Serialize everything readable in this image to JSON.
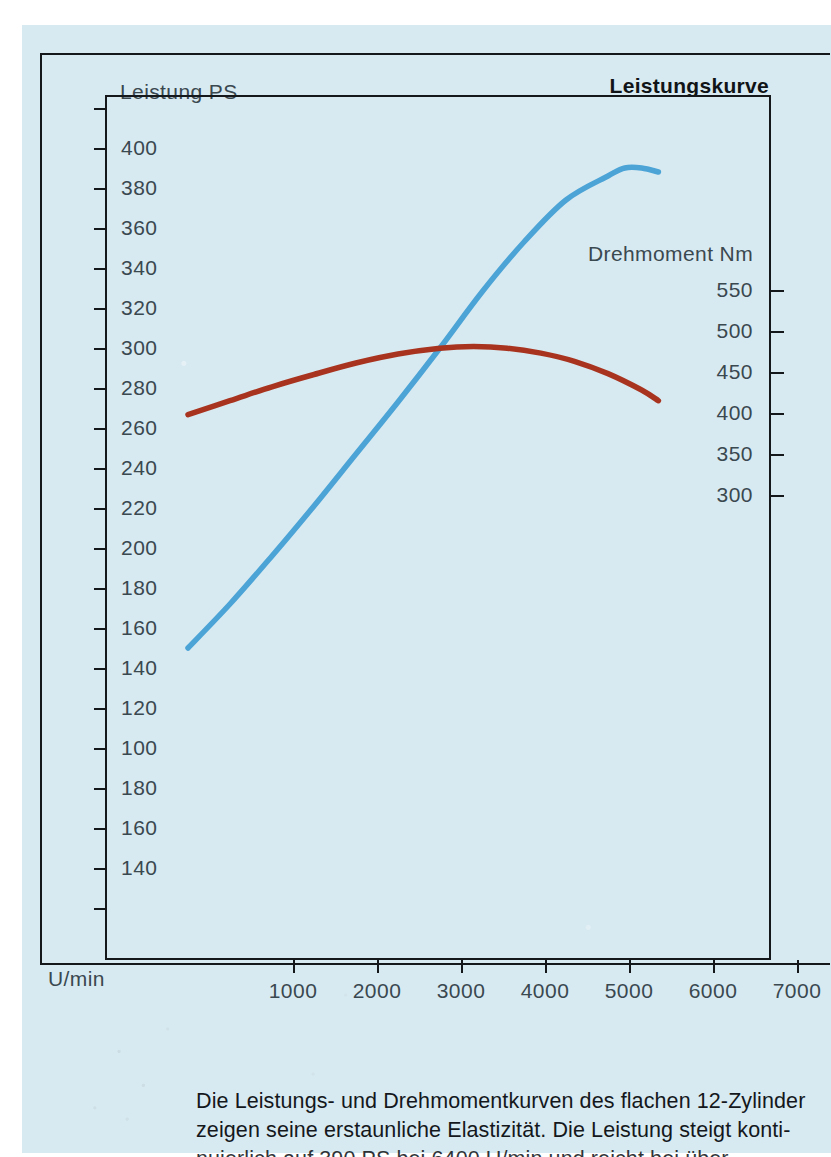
{
  "chart_title": "Leistungskurve",
  "axis_titles": {
    "left": "Leistung PS",
    "right": "Drehmoment Nm",
    "x": "U/min"
  },
  "caption": {
    "line1": "Die Leistungs- und Drehmomentkurven des flachen 12-Zylinder",
    "line2": "zeigen seine erstaunliche Elastizität. Die Leistung steigt konti-",
    "line3": "nuierlich auf 390 PS bei 6400 U/min und reicht bei über"
  },
  "colors": {
    "page": "#d8eaf1",
    "power_curve": "#4ba3d6",
    "torque_curve": "#a8341f",
    "axis": "#15181a",
    "tick_label": "#3a4850"
  },
  "chart_data": {
    "type": "line",
    "title": "Leistungskurve",
    "xlabel": "U/min",
    "ylabel": "Leistung PS",
    "y2label": "Drehmoment Nm",
    "xlim": [
      0,
      7600
    ],
    "xticks": [
      1000,
      2000,
      3000,
      4000,
      5000,
      6000,
      7000
    ],
    "xticklabels": [
      "1000",
      "2000",
      "3000",
      "4000",
      "5000",
      "6000",
      "7000"
    ],
    "ylim": [
      0,
      440
    ],
    "yticks": [
      420,
      400,
      380,
      360,
      340,
      320,
      300,
      280,
      260,
      240,
      220,
      200,
      180,
      160,
      140,
      120,
      100,
      80,
      60,
      40,
      20
    ],
    "yticklabels": [
      "",
      "400",
      "380",
      "360",
      "340",
      "320",
      "300",
      "280",
      "260",
      "240",
      "220",
      "200",
      "180",
      "160",
      "140",
      "120",
      "100",
      "180",
      "160",
      "140",
      ""
    ],
    "y2ticks": [
      550,
      500,
      450,
      400,
      350,
      300
    ],
    "y2ticklabels": [
      "550",
      "500",
      "450",
      "400",
      "350",
      "300"
    ],
    "grid": false,
    "legend": "none",
    "series": [
      {
        "name": "Leistung PS",
        "axis": "left",
        "color": "#4ba3d6",
        "x": [
          1000,
          1500,
          2000,
          2500,
          3000,
          3500,
          4000,
          4500,
          5000,
          5500,
          6000,
          6200,
          6400,
          6600
        ],
        "values": [
          150,
          172,
          196,
          221,
          247,
          273,
          300,
          328,
          353,
          374,
          386,
          390,
          390,
          388
        ]
      },
      {
        "name": "Drehmoment Nm",
        "axis": "right",
        "color": "#a8341f",
        "x": [
          1000,
          1500,
          2000,
          2500,
          3000,
          3500,
          4000,
          4400,
          4800,
          5200,
          5600,
          6000,
          6400,
          6600
        ],
        "values": [
          398,
          415,
          432,
          447,
          461,
          472,
          479,
          481,
          479,
          473,
          463,
          448,
          428,
          415
        ]
      }
    ]
  },
  "y_axis_left": {
    "ticks": [
      {
        "label": "",
        "y": 108
      },
      {
        "label": "400",
        "y": 148
      },
      {
        "label": "380",
        "y": 188
      },
      {
        "label": "360",
        "y": 228
      },
      {
        "label": "340",
        "y": 268
      },
      {
        "label": "320",
        "y": 308
      },
      {
        "label": "300",
        "y": 348
      },
      {
        "label": "280",
        "y": 388
      },
      {
        "label": "260",
        "y": 428
      },
      {
        "label": "240",
        "y": 468
      },
      {
        "label": "220",
        "y": 508
      },
      {
        "label": "200",
        "y": 548
      },
      {
        "label": "180",
        "y": 588
      },
      {
        "label": "160",
        "y": 628
      },
      {
        "label": "140",
        "y": 668
      },
      {
        "label": "120",
        "y": 708
      },
      {
        "label": "100",
        "y": 748
      },
      {
        "label": "180",
        "y": 788
      },
      {
        "label": "160",
        "y": 828
      },
      {
        "label": "140",
        "y": 868
      },
      {
        "label": "",
        "y": 908
      }
    ]
  },
  "y_axis_right": {
    "ticks": [
      {
        "label": "550",
        "y": 290
      },
      {
        "label": "500",
        "y": 331
      },
      {
        "label": "450",
        "y": 372
      },
      {
        "label": "400",
        "y": 413
      },
      {
        "label": "350",
        "y": 454
      },
      {
        "label": "300",
        "y": 495
      }
    ]
  },
  "x_axis": {
    "ticks": [
      {
        "label": "1000",
        "x": 188
      },
      {
        "label": "2000",
        "x": 272
      },
      {
        "label": "3000",
        "x": 356
      },
      {
        "label": "4000",
        "x": 440
      },
      {
        "label": "5000",
        "x": 524
      },
      {
        "label": "6000",
        "x": 608
      },
      {
        "label": "7000",
        "x": 692
      }
    ]
  }
}
